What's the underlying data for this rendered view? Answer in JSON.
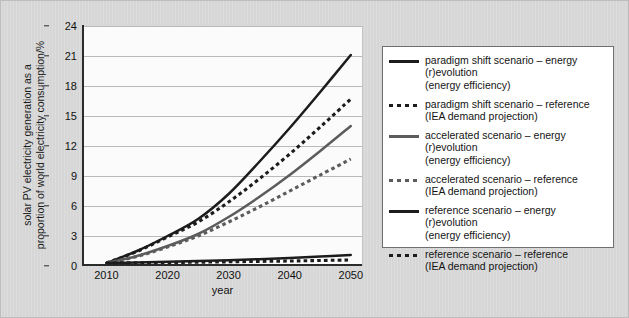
{
  "figure": {
    "background_color": "#d6d6d6",
    "plot_background_color": "#fbfbfb",
    "gridline_color": "#b9b9b9"
  },
  "axis": {
    "y_title_line1": "solar PV electricity generation as a",
    "y_title_line2": "proportion of world electricity consumption/%",
    "x_title": "year"
  },
  "legend": {
    "items": [
      {
        "style": "solid",
        "color": "#1c1c1c",
        "line1": "paradigm shift scenario – energy (r)evolution",
        "line2": "(energy efficiency)"
      },
      {
        "style": "dashed",
        "color": "#1c1c1c",
        "line1": "paradigm shift scenario – reference",
        "line2": "(IEA demand projection)"
      },
      {
        "style": "solid",
        "color": "#5c5c5c",
        "line1": "accelerated scenario – energy (r)evolution",
        "line2": "(energy efficiency)"
      },
      {
        "style": "dashed",
        "color": "#5c5c5c",
        "line1": "accelerated scenario – reference",
        "line2": "(IEA demand projection)"
      },
      {
        "style": "solid",
        "color": "#1c1c1c",
        "line1": "reference scenario – energy (r)evolution",
        "line2": "(energy efficiency)"
      },
      {
        "style": "dashed",
        "color": "#1c1c1c",
        "line1": "reference scenario – reference",
        "line2": "(IEA demand projection)"
      }
    ]
  },
  "chart_data": {
    "type": "line",
    "title": "",
    "xlabel": "year",
    "ylabel": "solar PV electricity generation as a proportion of world electricity consumption/%",
    "x": [
      2010,
      2015,
      2020,
      2025,
      2030,
      2035,
      2040,
      2045,
      2050
    ],
    "xlim": [
      2006,
      2052
    ],
    "ylim": [
      0,
      24
    ],
    "xticks": [
      2010,
      2020,
      2030,
      2040,
      2050
    ],
    "yticks": [
      0,
      3,
      6,
      9,
      12,
      15,
      18,
      21,
      24
    ],
    "grid": true,
    "legend_position": "right",
    "series": [
      {
        "name": "paradigm shift scenario – energy (r)evolution (energy efficiency)",
        "style": "solid",
        "color": "#1c1c1c",
        "values": [
          0.3,
          1.5,
          3.0,
          4.7,
          7.2,
          10.4,
          13.8,
          17.4,
          21.1
        ]
      },
      {
        "name": "paradigm shift scenario – reference (IEA demand projection)",
        "style": "dashed",
        "color": "#1c1c1c",
        "values": [
          0.3,
          1.45,
          2.9,
          4.4,
          6.4,
          8.7,
          11.2,
          13.9,
          16.7
        ]
      },
      {
        "name": "accelerated scenario – energy (r)evolution (energy efficiency)",
        "style": "solid",
        "color": "#5c5c5c",
        "values": [
          0.3,
          1.0,
          2.0,
          3.2,
          4.9,
          6.9,
          9.1,
          11.5,
          14.0
        ]
      },
      {
        "name": "accelerated scenario – reference (IEA demand projection)",
        "style": "dashed",
        "color": "#5c5c5c",
        "values": [
          0.3,
          0.95,
          1.9,
          3.0,
          4.4,
          5.9,
          7.5,
          9.1,
          10.7
        ]
      },
      {
        "name": "reference scenario – energy (r)evolution (energy efficiency)",
        "style": "solid",
        "color": "#1c1c1c",
        "values": [
          0.3,
          0.35,
          0.42,
          0.5,
          0.58,
          0.68,
          0.8,
          0.95,
          1.1
        ]
      },
      {
        "name": "reference scenario – reference (IEA demand projection)",
        "style": "dashed",
        "color": "#1c1c1c",
        "values": [
          0.3,
          0.32,
          0.35,
          0.38,
          0.42,
          0.46,
          0.5,
          0.55,
          0.6
        ]
      }
    ]
  }
}
